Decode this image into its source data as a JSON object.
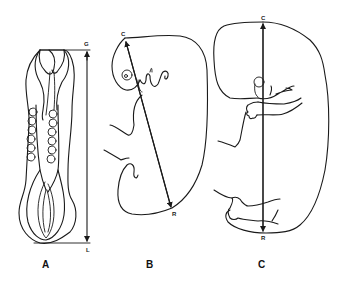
{
  "figure": {
    "panels": [
      {
        "id": "A",
        "label": "A",
        "description": "Early embryo, dorsal view, greatest length measurement",
        "measurement": {
          "start_label": "G",
          "end_label": "L",
          "name": "greatest length"
        }
      },
      {
        "id": "B",
        "label": "B",
        "description": "Curved embryo, lateral view, crown-rump measurement",
        "measurement": {
          "start_label": "C",
          "end_label": "R",
          "name": "crown-rump length"
        }
      },
      {
        "id": "C",
        "label": "C",
        "description": "Older embryo, lateral view, crown-rump measurement",
        "measurement": {
          "start_label": "C",
          "end_label": "R",
          "name": "crown-rump length"
        }
      }
    ],
    "colors": {
      "line": "#1a1a1a",
      "background": "#ffffff"
    }
  }
}
